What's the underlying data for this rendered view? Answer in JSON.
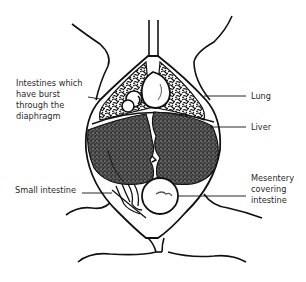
{
  "diagram": {
    "labels": {
      "intestines_burst": "Intestines which\nhave burst\nthrough the\ndiaphragm",
      "lung": "Lung",
      "liver": "Liver",
      "small_intestine": "Small intestine",
      "mesentery": "Mesentery\ncovering\nintestine"
    },
    "colors": {
      "ink": "#111111",
      "text": "#2a2a2a",
      "background": "#ffffff"
    }
  }
}
